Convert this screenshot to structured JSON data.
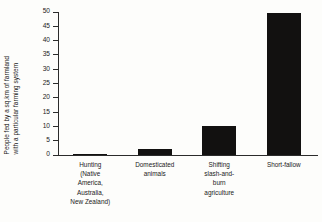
{
  "chart_data": {
    "type": "bar",
    "title": "",
    "subtitle": "",
    "xlabel": "",
    "ylabel": "People fed by a sq.km of farmland with a particular farming system",
    "ylabel_lines": [
      "People fed by a sq.km of farmland",
      "with a particular farming system"
    ],
    "categories": [
      "Hunting\n(Native\nAmerica,\nAustralia,\nNew Zealand)",
      "Domesticated\nanimals",
      "Shifting\nslash-and-\nburn\nagriculture",
      "Short-fallow"
    ],
    "category_labels_flat": [
      "Hunting (Native America, Australia, New Zealand)",
      "Domesticated animals",
      "Shifting slash-and-burn agriculture",
      "Short-fallow"
    ],
    "values": [
      0.1,
      2,
      10,
      49.5
    ],
    "ylim": [
      0,
      50
    ],
    "yticks": [
      0,
      5,
      10,
      15,
      20,
      25,
      30,
      35,
      40,
      45,
      50
    ],
    "ytick_labels": [
      "0",
      "5",
      "10",
      "15",
      "20",
      "25",
      "30",
      "35",
      "40",
      "45",
      "50"
    ],
    "grid": false,
    "legend": null,
    "legend_position": "none",
    "bar_color": "#121110",
    "axis_color": "#2b2b2b",
    "background_color": "#fdfdfb"
  }
}
